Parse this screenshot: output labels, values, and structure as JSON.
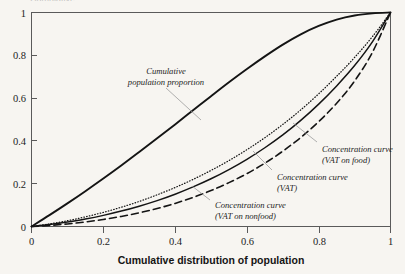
{
  "figure": {
    "background_color": "#f7f5f1",
    "ink_color": "#1a1a1a",
    "leader_color": "#9c9c9c",
    "cropped_top_text": "Cumulative"
  },
  "chart_data": {
    "type": "line",
    "title": "",
    "xlabel": "Cumulative distribution of population",
    "ylabel": "",
    "xlim": [
      0,
      1
    ],
    "ylim": [
      0,
      1
    ],
    "grid": false,
    "legend_position": "inline-annotations",
    "xticks": [
      "0",
      "0.2",
      "0.4",
      "0.6",
      "0.8",
      "1"
    ],
    "xtick_values": [
      0,
      0.2,
      0.4,
      0.6,
      0.8,
      1
    ],
    "yticks": [
      "0",
      "0.2",
      "0.4",
      "0.6",
      "0.8",
      "1"
    ],
    "ytick_values": [
      0,
      0.2,
      0.4,
      0.6,
      0.8,
      1
    ],
    "x": [
      0,
      0.05,
      0.1,
      0.15,
      0.2,
      0.25,
      0.3,
      0.35,
      0.4,
      0.45,
      0.5,
      0.55,
      0.6,
      0.65,
      0.7,
      0.75,
      0.8,
      0.85,
      0.9,
      0.95,
      1
    ],
    "series": [
      {
        "name": "Cumulative population proportion",
        "style": "solid-thick",
        "values": [
          0,
          0.053,
          0.108,
          0.165,
          0.224,
          0.285,
          0.348,
          0.412,
          0.477,
          0.543,
          0.609,
          0.674,
          0.736,
          0.795,
          0.85,
          0.898,
          0.937,
          0.967,
          0.986,
          0.996,
          1
        ]
      },
      {
        "name": "Concentration curve (VAT on food)",
        "style": "dotted",
        "values": [
          0,
          0.012,
          0.027,
          0.045,
          0.066,
          0.09,
          0.117,
          0.148,
          0.182,
          0.22,
          0.262,
          0.308,
          0.359,
          0.415,
          0.477,
          0.545,
          0.62,
          0.702,
          0.79,
          0.888,
          1
        ]
      },
      {
        "name": "Concentration curve (VAT)",
        "style": "solid-thin",
        "values": [
          0,
          0.009,
          0.021,
          0.035,
          0.052,
          0.072,
          0.095,
          0.121,
          0.151,
          0.185,
          0.223,
          0.266,
          0.314,
          0.368,
          0.428,
          0.496,
          0.572,
          0.657,
          0.752,
          0.864,
          1
        ]
      },
      {
        "name": "Concentration curve (VAT on nonfood)",
        "style": "dashed",
        "values": [
          0,
          0.005,
          0.012,
          0.021,
          0.033,
          0.047,
          0.064,
          0.084,
          0.108,
          0.136,
          0.168,
          0.205,
          0.247,
          0.296,
          0.352,
          0.416,
          0.49,
          0.576,
          0.68,
          0.815,
          1
        ]
      }
    ],
    "annotations": [
      {
        "id": "cumulative-population-proportion",
        "line1": "Cumulative",
        "line2": "population proportion",
        "anchor_x": 0.47,
        "anchor_y": 0.545
      },
      {
        "id": "concentration-curve-vat-on-food",
        "line1": "Concentration curve",
        "line2": "(VAT on food)",
        "anchor_x": 0.77,
        "anchor_y": 0.585
      },
      {
        "id": "concentration-curve-vat",
        "line1": "Concentration curve",
        "line2": "(VAT)",
        "anchor_x": 0.655,
        "anchor_y": 0.372
      },
      {
        "id": "concentration-curve-vat-on-nonfood",
        "line1": "Concentration curve",
        "line2": "(VAT on nonfood)",
        "anchor_x": 0.47,
        "anchor_y": 0.152
      }
    ]
  }
}
